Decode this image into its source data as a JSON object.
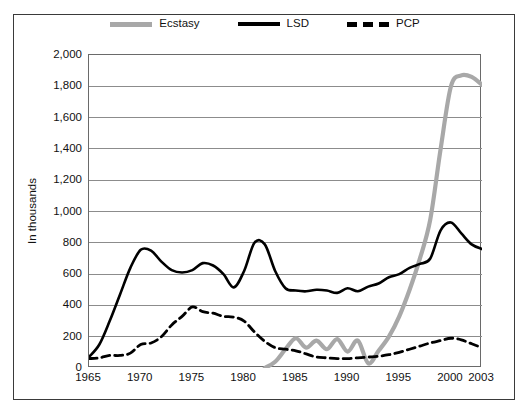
{
  "chart_data": {
    "type": "line",
    "title": "",
    "xlabel": "",
    "ylabel": "In thousands",
    "xlim": [
      1965,
      2003
    ],
    "ylim": [
      0,
      2000
    ],
    "ytick_labels": [
      "2,000",
      "1,800",
      "1,600",
      "1,400",
      "1,200",
      "1,000",
      "800",
      "600",
      "400",
      "200",
      "0"
    ],
    "ytick_values": [
      2000,
      1800,
      1600,
      1400,
      1200,
      1000,
      800,
      600,
      400,
      200,
      0
    ],
    "xtick_labels": [
      "1965",
      "1970",
      "1975",
      "1980",
      "1985",
      "1990",
      "1995",
      "2000",
      "2003"
    ],
    "xtick_values": [
      1965,
      1970,
      1975,
      1980,
      1985,
      1990,
      1995,
      2000,
      2003
    ],
    "grid": "horizontal",
    "legend_position": "top-center",
    "colors": {
      "Ecstasy": "#a8a8a8",
      "LSD": "#000000",
      "PCP": "#000000",
      "grid": "#8c8c8c",
      "frame": "#6a6a6a"
    },
    "series": [
      {
        "name": "Ecstasy",
        "style": "solid-thick-gray",
        "x": [
          1982,
          1983,
          1984,
          1985,
          1986,
          1987,
          1988,
          1989,
          1990,
          1991,
          1992,
          1993,
          1994,
          1995,
          1996,
          1997,
          1998,
          1999,
          2000,
          2001,
          2002,
          2003
        ],
        "values": [
          0,
          40,
          120,
          190,
          130,
          175,
          120,
          185,
          105,
          175,
          30,
          110,
          200,
          330,
          500,
          700,
          950,
          1400,
          1800,
          1870,
          1860,
          1810
        ]
      },
      {
        "name": "LSD",
        "style": "solid-black",
        "x": [
          1965,
          1966,
          1967,
          1968,
          1969,
          1970,
          1971,
          1972,
          1973,
          1974,
          1975,
          1976,
          1977,
          1978,
          1979,
          1980,
          1981,
          1982,
          1983,
          1984,
          1985,
          1986,
          1987,
          1988,
          1989,
          1990,
          1991,
          1992,
          1993,
          1994,
          1995,
          1996,
          1997,
          1998,
          1999,
          2000,
          2001,
          2002,
          2003
        ],
        "values": [
          70,
          150,
          300,
          470,
          640,
          755,
          750,
          680,
          625,
          610,
          625,
          670,
          655,
          600,
          515,
          620,
          800,
          790,
          620,
          510,
          495,
          490,
          500,
          495,
          480,
          510,
          490,
          520,
          540,
          580,
          600,
          640,
          665,
          700,
          880,
          930,
          860,
          790,
          760
        ]
      },
      {
        "name": "PCP",
        "style": "dashed-black",
        "x": [
          1965,
          1966,
          1967,
          1968,
          1969,
          1970,
          1971,
          1972,
          1973,
          1974,
          1975,
          1976,
          1977,
          1978,
          1979,
          1980,
          1981,
          1982,
          1983,
          1984,
          1985,
          1986,
          1987,
          1988,
          1989,
          1990,
          1991,
          1992,
          1993,
          1994,
          1995,
          1996,
          1997,
          1998,
          1999,
          2000,
          2001,
          2002,
          2003
        ],
        "values": [
          60,
          65,
          80,
          80,
          95,
          150,
          160,
          200,
          275,
          330,
          390,
          360,
          350,
          330,
          325,
          300,
          230,
          170,
          130,
          120,
          110,
          90,
          70,
          65,
          60,
          60,
          65,
          70,
          75,
          85,
          100,
          120,
          140,
          160,
          175,
          190,
          180,
          155,
          130
        ]
      }
    ],
    "legend": [
      {
        "label": "Ecstasy",
        "swatch": "ecstasy-swatch"
      },
      {
        "label": "LSD",
        "swatch": "lsd-swatch"
      },
      {
        "label": "PCP",
        "swatch": "pcp-swatch"
      }
    ]
  }
}
